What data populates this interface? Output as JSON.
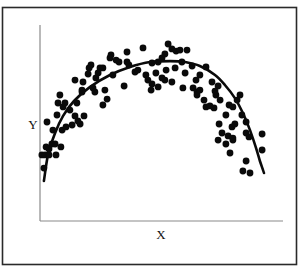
{
  "chart_data": {
    "type": "scatter",
    "title": "",
    "xlabel": "X",
    "ylabel": "Y",
    "xlim": [
      0,
      10
    ],
    "ylim": [
      0,
      10
    ],
    "grid": false,
    "legend": "none",
    "ticks": {
      "x": [],
      "y": []
    },
    "colors": {
      "points": "#0a0a0a",
      "curve": "#0a0a0a",
      "axes": "#8a8a8a",
      "frame": "#2a2a2a"
    },
    "series": [
      {
        "name": "observations",
        "kind": "points",
        "points": [
          [
            4.24,
            8.83
          ],
          [
            5.27,
            9.03
          ],
          [
            5.43,
            8.78
          ],
          [
            5.6,
            8.67
          ],
          [
            5.14,
            8.52
          ],
          [
            5.76,
            8.72
          ],
          [
            6.05,
            8.72
          ],
          [
            5.02,
            8.32
          ],
          [
            4.86,
            8.11
          ],
          [
            4.61,
            8.06
          ],
          [
            3.58,
            8.62
          ],
          [
            2.92,
            8.47
          ],
          [
            2.88,
            8.32
          ],
          [
            3.13,
            8.21
          ],
          [
            3.25,
            8.11
          ],
          [
            3.58,
            8.11
          ],
          [
            3.66,
            7.96
          ],
          [
            2.1,
            7.96
          ],
          [
            2.02,
            7.81
          ],
          [
            2.47,
            7.81
          ],
          [
            2.59,
            7.81
          ],
          [
            2.39,
            7.55
          ],
          [
            2.3,
            7.3
          ],
          [
            1.98,
            7.5
          ],
          [
            1.44,
            7.19
          ],
          [
            1.73,
            6.68
          ],
          [
            1.77,
            7.09
          ],
          [
            2.18,
            6.79
          ],
          [
            2.26,
            6.58
          ],
          [
            2.67,
            6.68
          ],
          [
            2.59,
            5.92
          ],
          [
            2.76,
            6.22
          ],
          [
            3.46,
            6.89
          ],
          [
            3.0,
            7.45
          ],
          [
            3.91,
            7.6
          ],
          [
            4.03,
            7.7
          ],
          [
            4.36,
            7.45
          ],
          [
            4.44,
            7.19
          ],
          [
            4.77,
            7.55
          ],
          [
            4.61,
            6.99
          ],
          [
            4.86,
            6.84
          ],
          [
            4.57,
            6.68
          ],
          [
            5.14,
            7.19
          ],
          [
            5.19,
            7.7
          ],
          [
            5.02,
            7.3
          ],
          [
            5.43,
            7.09
          ],
          [
            5.56,
            7.81
          ],
          [
            5.84,
            8.11
          ],
          [
            6.26,
            7.91
          ],
          [
            5.97,
            7.55
          ],
          [
            6.42,
            7.19
          ],
          [
            6.83,
            7.86
          ],
          [
            6.58,
            7.45
          ],
          [
            7.08,
            7.09
          ],
          [
            7.33,
            6.89
          ],
          [
            5.88,
            6.79
          ],
          [
            6.3,
            6.79
          ],
          [
            6.46,
            6.58
          ],
          [
            6.46,
            6.43
          ],
          [
            6.75,
            6.17
          ],
          [
            6.83,
            5.82
          ],
          [
            6.99,
            5.87
          ],
          [
            7.16,
            5.77
          ],
          [
            7.24,
            6.43
          ],
          [
            7.41,
            6.17
          ],
          [
            7.2,
            6.63
          ],
          [
            6.58,
            6.68
          ],
          [
            0.95,
            5.82
          ],
          [
            1.03,
            6.02
          ],
          [
            0.74,
            6.02
          ],
          [
            0.82,
            6.43
          ],
          [
            0.7,
            5.41
          ],
          [
            0.29,
            5.05
          ],
          [
            0.53,
            4.64
          ],
          [
            0.91,
            4.64
          ],
          [
            1.07,
            4.8
          ],
          [
            1.32,
            4.9
          ],
          [
            1.23,
            5.66
          ],
          [
            1.52,
            6.02
          ],
          [
            1.73,
            6.58
          ],
          [
            1.65,
            4.95
          ],
          [
            1.56,
            5.1
          ],
          [
            1.81,
            5.36
          ],
          [
            1.44,
            5.36
          ],
          [
            0.49,
            3.93
          ],
          [
            0.37,
            3.67
          ],
          [
            0.62,
            3.93
          ],
          [
            0.25,
            3.78
          ],
          [
            0.08,
            3.37
          ],
          [
            0.21,
            3.37
          ],
          [
            0.37,
            3.37
          ],
          [
            0.66,
            3.37
          ],
          [
            0.86,
            3.78
          ],
          [
            0.16,
            2.7
          ],
          [
            8.23,
            6.43
          ],
          [
            8.11,
            6.17
          ],
          [
            7.78,
            5.92
          ],
          [
            7.94,
            5.82
          ],
          [
            7.65,
            5.41
          ],
          [
            8.31,
            5.41
          ],
          [
            7.9,
            4.8
          ],
          [
            8.48,
            5.05
          ],
          [
            7.37,
            4.95
          ],
          [
            8.02,
            4.95
          ],
          [
            8.48,
            4.49
          ],
          [
            7.49,
            4.49
          ],
          [
            7.74,
            4.34
          ],
          [
            7.94,
            4.13
          ],
          [
            7.65,
            3.93
          ],
          [
            8.6,
            4.29
          ],
          [
            9.14,
            4.44
          ],
          [
            7.82,
            3.47
          ],
          [
            8.48,
            3.06
          ],
          [
            9.14,
            3.62
          ],
          [
            8.35,
            2.55
          ],
          [
            8.64,
            2.45
          ],
          [
            7.94,
            4.23
          ],
          [
            7.33,
            4.13
          ]
        ]
      },
      {
        "name": "fitted-curve",
        "kind": "line",
        "points": [
          [
            0.16,
            2.04
          ],
          [
            0.33,
            3.37
          ],
          [
            0.62,
            4.49
          ],
          [
            0.95,
            5.36
          ],
          [
            1.4,
            6.12
          ],
          [
            2.06,
            6.84
          ],
          [
            2.88,
            7.45
          ],
          [
            3.7,
            7.86
          ],
          [
            4.53,
            8.11
          ],
          [
            5.35,
            8.16
          ],
          [
            5.97,
            8.11
          ],
          [
            6.58,
            7.91
          ],
          [
            7.2,
            7.45
          ],
          [
            7.61,
            6.94
          ],
          [
            8.02,
            6.27
          ],
          [
            8.35,
            5.51
          ],
          [
            8.64,
            4.64
          ],
          [
            8.89,
            3.73
          ],
          [
            9.05,
            3.06
          ],
          [
            9.22,
            2.45
          ]
        ]
      }
    ]
  }
}
